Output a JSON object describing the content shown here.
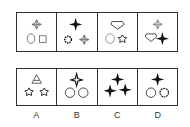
{
  "puzzle": {
    "question_row": [
      {
        "index": 1,
        "shapes": [
          "cross-star-outline",
          "circle",
          "square"
        ]
      },
      {
        "index": 2,
        "shapes": [
          "four-point-star-filled",
          "gear",
          "cross-star-outline"
        ]
      },
      {
        "index": 3,
        "shapes": [
          "heart-shield",
          "circle",
          "pentagon-star"
        ]
      },
      {
        "index": 4,
        "shapes": [
          "cross-star-outline",
          "heart-shield",
          "four-point-star-filled"
        ]
      }
    ],
    "options": [
      {
        "label": "A",
        "shapes": [
          "triangle-a",
          "pentagon-star",
          "pentagon-star"
        ]
      },
      {
        "label": "B",
        "shapes": [
          "four-point-star-filled",
          "circle",
          "circle"
        ]
      },
      {
        "label": "C",
        "shapes": [
          "four-point-star-filled",
          "four-point-star-filled",
          "four-point-star-filled"
        ]
      },
      {
        "label": "D",
        "shapes": [
          "four-point-star-filled",
          "circle",
          "gear"
        ]
      }
    ]
  }
}
